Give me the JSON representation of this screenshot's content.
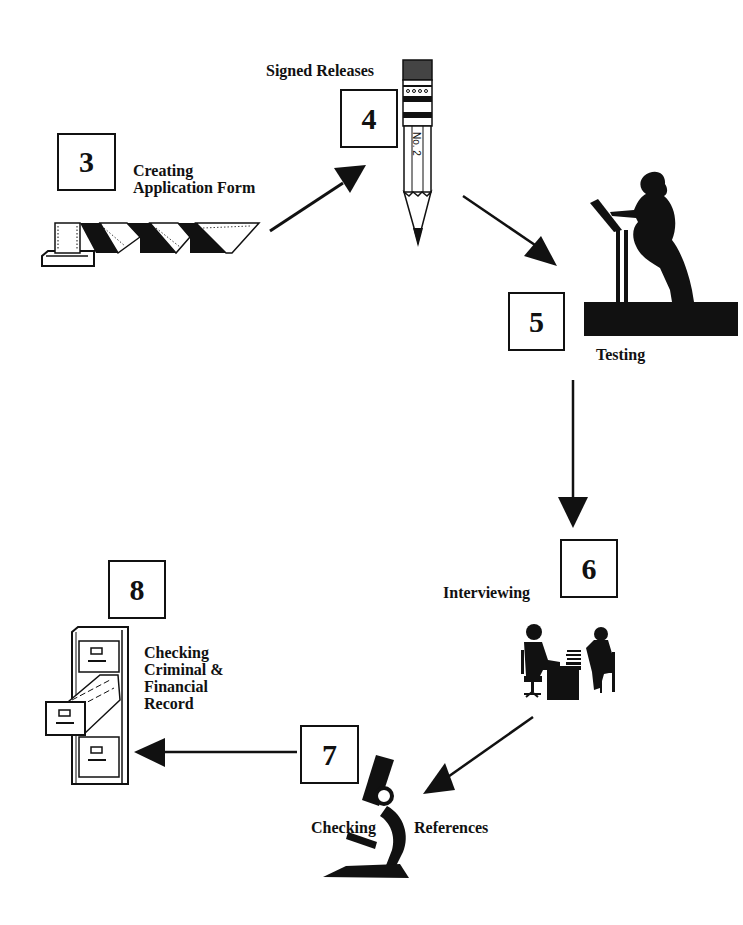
{
  "diagram": {
    "type": "process-cycle",
    "steps": [
      {
        "number": "3",
        "label_lines": [
          "Creating",
          "Application Form"
        ],
        "icon": "printer-paper-icon"
      },
      {
        "number": "4",
        "label_lines": [
          "Signed Releases"
        ],
        "icon": "pencil-icon",
        "icon_text": "No. 2"
      },
      {
        "number": "5",
        "label_lines": [
          "Testing"
        ],
        "icon": "person-at-lectern-icon"
      },
      {
        "number": "6",
        "label_lines": [
          "Interviewing"
        ],
        "icon": "interview-desk-icon"
      },
      {
        "number": "7",
        "label_lines": [
          "Checking",
          "References"
        ],
        "icon": "microscope-icon"
      },
      {
        "number": "8",
        "label_lines": [
          "Checking",
          "Criminal &",
          "Financial",
          "Record"
        ],
        "icon": "file-cabinet-icon"
      }
    ],
    "flow": [
      "3 → 4",
      "4 → 5",
      "5 → 6",
      "6 → 7",
      "7 → 8"
    ],
    "colors": {
      "ink": "#111111",
      "background": "#ffffff"
    }
  }
}
